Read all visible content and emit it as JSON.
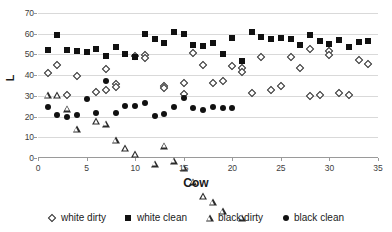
{
  "chart_data": {
    "type": "scatter",
    "title": "",
    "xlabel": "Cow",
    "ylabel": "L",
    "xlim": [
      0,
      35
    ],
    "ylim": [
      0,
      70
    ],
    "xticks": [
      0,
      5,
      10,
      15,
      20,
      25,
      30,
      35
    ],
    "yticks": [
      0,
      10,
      20,
      30,
      40,
      50,
      60,
      70
    ],
    "grid": true,
    "legend_position": "bottom",
    "series": [
      {
        "name": "white dirty",
        "marker": "open-diamond",
        "color": "#2b2b2b",
        "x": [
          1,
          2,
          3,
          4,
          6,
          7,
          7,
          8,
          8,
          10,
          11,
          11,
          13,
          13,
          15,
          15,
          16,
          17,
          18,
          19,
          20,
          21,
          21,
          22,
          23,
          24,
          25,
          26,
          27,
          28,
          28,
          29,
          30,
          30,
          31,
          32,
          33,
          34
        ],
        "y": [
          41.2,
          45.0,
          30.3,
          39.7,
          31.7,
          43.2,
          33.0,
          35.7,
          34.2,
          49.2,
          49.5,
          48.2,
          35.0,
          34.0,
          36.0,
          30.8,
          50.8,
          45.0,
          36.0,
          37.0,
          44.2,
          43.5,
          41.5,
          31.3,
          48.8,
          32.8,
          34.7,
          48.8,
          43.3,
          52.5,
          30.0,
          30.2,
          51.5,
          49.8,
          31.2,
          30.6,
          47.5,
          45.3
        ]
      },
      {
        "name": "white clean",
        "marker": "filled-square",
        "color": "#111111",
        "x": [
          1,
          2,
          3,
          4,
          5,
          6,
          7,
          8,
          9,
          10,
          11,
          12,
          13,
          14,
          15,
          16,
          17,
          18,
          19,
          20,
          21,
          22,
          23,
          24,
          25,
          26,
          27,
          28,
          29,
          30,
          31,
          32,
          33,
          34
        ],
        "y": [
          51.9,
          59.6,
          52.0,
          51.8,
          51.2,
          52.6,
          49.4,
          53.4,
          50.0,
          48.6,
          59.8,
          57.5,
          55.6,
          60.8,
          60.0,
          54.5,
          54.0,
          55.7,
          50.0,
          58.1,
          46.6,
          61.0,
          58.5,
          57.4,
          57.7,
          57.4,
          54.7,
          59.5,
          56.5,
          55.2,
          57.0,
          53.7,
          56.2,
          56.3
        ]
      },
      {
        "name": "black dirty",
        "marker": "open-triangle",
        "color": "#2b2b2b",
        "x": [
          1,
          2,
          3,
          4,
          6,
          7,
          8,
          9,
          10,
          12,
          13,
          14,
          15,
          16,
          17,
          18,
          19,
          21
        ],
        "y": [
          30.2,
          33.6,
          30.5,
          24.0,
          31.4,
          33.5,
          29.0,
          28.5,
          28.8,
          27.7,
          39.8,
          35.8,
          35.9,
          32.5,
          29.0,
          29.3,
          28.3,
          28.7
        ]
      },
      {
        "name": "black clean",
        "marker": "filled-circle",
        "color": "#111111",
        "x": [
          1,
          2,
          3,
          4,
          5,
          6,
          7,
          8,
          9,
          10,
          11,
          12,
          13,
          14,
          15,
          16,
          17,
          18,
          19,
          20
        ],
        "y": [
          24.7,
          20.8,
          19.7,
          21.0,
          28.5,
          21.7,
          37.2,
          21.9,
          25.2,
          25.2,
          26.5,
          20.2,
          21.2,
          24.6,
          28.9,
          24.3,
          23.0,
          24.5,
          24.2,
          24.2
        ]
      }
    ]
  }
}
